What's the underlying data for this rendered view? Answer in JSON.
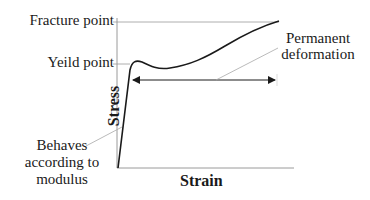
{
  "diagram": {
    "type": "stress-strain-curve",
    "axes": {
      "x_label": "Strain",
      "y_label": "Stress"
    },
    "tick_labels": {
      "fracture_point": "Fracture point",
      "yield_point": "Yeild point"
    },
    "annotations": {
      "permanent_deformation": [
        "Permanent",
        "deformation"
      ],
      "modulus_behavior": [
        "Behaves",
        "according to",
        "modulus"
      ]
    },
    "colors": {
      "curve": "#1a1a1a",
      "axis": "#9a9a9a",
      "leader": "#a8a8a8",
      "text": "#1a1a1a",
      "background": "#ffffff"
    }
  }
}
